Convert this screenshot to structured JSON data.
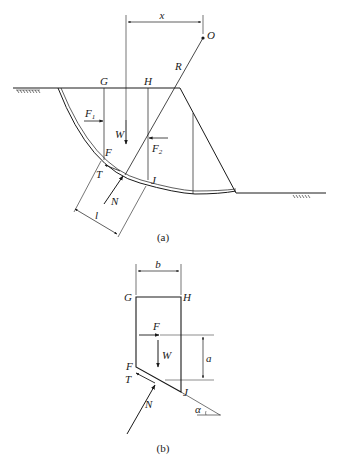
{
  "figure": {
    "part_a": {
      "caption": "(a)",
      "labels": {
        "x": "x",
        "O": "O",
        "R": "R",
        "G": "G",
        "H": "H",
        "F1": "F",
        "F1_sub": "1",
        "W": "W",
        "F2": "F",
        "F2_sub": "2",
        "F": "F",
        "T": "T",
        "J": "J",
        "N": "N",
        "l": "l"
      }
    },
    "part_b": {
      "caption": "(b)",
      "labels": {
        "b": "b",
        "G": "G",
        "H": "H",
        "F_force": "F",
        "W": "W",
        "a": "a",
        "F": "F",
        "T": "T",
        "J": "J",
        "N": "N",
        "alpha": "α"
      }
    },
    "colors": {
      "ink": "#1a1a1a",
      "background": "#ffffff"
    }
  }
}
